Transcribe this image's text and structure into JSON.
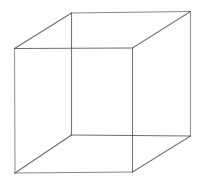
{
  "figure": {
    "type": "necker-cube",
    "background": "#ffffff",
    "stroke_color": "#555555",
    "stroke_width": 1.1,
    "vertices": {
      "front_tl": [
        14.5,
        48.5
      ],
      "front_tr": [
        132.5,
        48
      ],
      "front_bl": [
        15,
        173
      ],
      "front_br": [
        132.5,
        172
      ],
      "back_tl": [
        71.5,
        13
      ],
      "back_tr": [
        190.5,
        11.5
      ],
      "back_bl": [
        71.5,
        135
      ],
      "back_br": [
        190.5,
        136
      ]
    },
    "edges": [
      {
        "name": "front-top-edge",
        "from": "front_tl",
        "to": "front_tr",
        "opacity": 0.85
      },
      {
        "name": "front-bottom-edge",
        "from": "front_bl",
        "to": "front_br",
        "opacity": 0.7
      },
      {
        "name": "front-left-edge",
        "from": "front_tl",
        "to": "front_bl",
        "opacity": 0.6
      },
      {
        "name": "front-right-edge",
        "from": "front_tr",
        "to": "front_br",
        "opacity": 0.8
      },
      {
        "name": "back-top-edge",
        "from": "back_tl",
        "to": "back_tr",
        "opacity": 0.7
      },
      {
        "name": "back-bottom-edge",
        "from": "back_bl",
        "to": "back_br",
        "opacity": 0.85
      },
      {
        "name": "back-left-edge",
        "from": "back_tl",
        "to": "back_bl",
        "opacity": 0.8
      },
      {
        "name": "back-right-edge",
        "from": "back_tr",
        "to": "back_br",
        "opacity": 0.6
      },
      {
        "name": "top-left-connector",
        "from": "front_tl",
        "to": "back_tl",
        "opacity": 0.85
      },
      {
        "name": "top-right-connector",
        "from": "front_tr",
        "to": "back_tr",
        "opacity": 0.8
      },
      {
        "name": "bottom-left-connector",
        "from": "front_bl",
        "to": "back_bl",
        "opacity": 0.85
      },
      {
        "name": "bottom-right-connector",
        "from": "front_br",
        "to": "back_br",
        "opacity": 0.8
      }
    ]
  }
}
